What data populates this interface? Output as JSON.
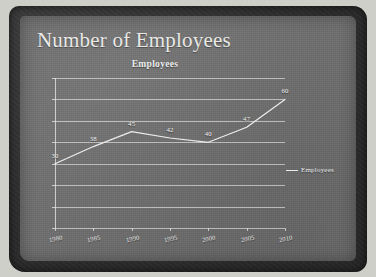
{
  "slide": {
    "title": "Number of Employees",
    "background_color": "#6f6f6f",
    "border_color": "#2c2c2c",
    "text_color": "#e9e9e6"
  },
  "legend": {
    "label": "Employees",
    "position": "right",
    "marker": "line-marker"
  },
  "chart_data": {
    "type": "line",
    "title": "Employees",
    "xlabel": "",
    "ylabel": "",
    "categories": [
      "1980",
      "1985",
      "1990",
      "1995",
      "2000",
      "2005",
      "2010"
    ],
    "values": [
      30,
      38,
      45,
      42,
      40,
      47,
      60
    ],
    "series": [
      {
        "name": "Employees",
        "values": [
          30,
          38,
          45,
          42,
          40,
          47,
          60
        ]
      }
    ],
    "ylim": [
      0,
      70
    ],
    "yticks": [
      0,
      10,
      20,
      30,
      40,
      50,
      60,
      70
    ],
    "ytick_labels": [
      "0",
      "10",
      "20",
      "30",
      "40",
      "50",
      "60",
      "70"
    ],
    "data_labels": [
      "30",
      "38",
      "45",
      "42",
      "40",
      "47",
      "60"
    ],
    "grid": true,
    "legend_position": "right",
    "line_color": "#ededed",
    "show_markers": false
  }
}
